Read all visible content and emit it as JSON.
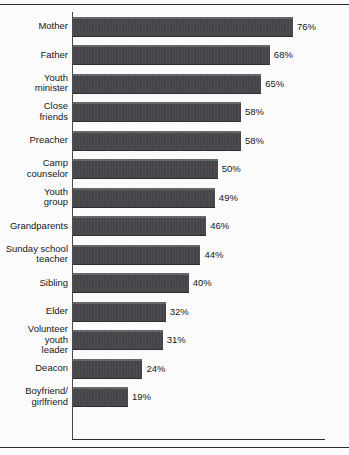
{
  "chart_data": {
    "type": "bar",
    "orientation": "horizontal",
    "title": "",
    "subtitle": "",
    "xlabel": "",
    "ylabel": "",
    "xlim": [
      0,
      87
    ],
    "grid": false,
    "legend": null,
    "value_suffix": "%",
    "categories": [
      "Mother",
      "Father",
      "Youth minister",
      "Close friends",
      "Preacher",
      "Camp counselor",
      "Youth group",
      "Grandparents",
      "Sunday school teacher",
      "Sibling",
      "Elder",
      "Volunteer youth leader",
      "Deacon",
      "Boyfriend/girlfriend"
    ],
    "values": [
      76,
      68,
      65,
      58,
      58,
      50,
      49,
      46,
      44,
      40,
      32,
      31,
      24,
      19
    ],
    "bar_color": "#46464a"
  },
  "rows": [
    {
      "label_lines": [
        "Mother"
      ],
      "value": 76,
      "value_label": "76%"
    },
    {
      "label_lines": [
        "Father"
      ],
      "value": 68,
      "value_label": "68%"
    },
    {
      "label_lines": [
        "Youth",
        "minister"
      ],
      "value": 65,
      "value_label": "65%"
    },
    {
      "label_lines": [
        "Close",
        "friends"
      ],
      "value": 58,
      "value_label": "58%"
    },
    {
      "label_lines": [
        "Preacher"
      ],
      "value": 58,
      "value_label": "58%"
    },
    {
      "label_lines": [
        "Camp",
        "counselor"
      ],
      "value": 50,
      "value_label": "50%"
    },
    {
      "label_lines": [
        "Youth",
        "group"
      ],
      "value": 49,
      "value_label": "49%"
    },
    {
      "label_lines": [
        "Grandparents"
      ],
      "value": 46,
      "value_label": "46%"
    },
    {
      "label_lines": [
        "Sunday school",
        "teacher"
      ],
      "value": 44,
      "value_label": "44%"
    },
    {
      "label_lines": [
        "Sibling"
      ],
      "value": 40,
      "value_label": "40%"
    },
    {
      "label_lines": [
        "Elder"
      ],
      "value": 32,
      "value_label": "32%"
    },
    {
      "label_lines": [
        "Volunteer",
        "youth",
        "leader"
      ],
      "value": 31,
      "value_label": "31%"
    },
    {
      "label_lines": [
        "Deacon"
      ],
      "value": 24,
      "value_label": "24%"
    },
    {
      "label_lines": [
        "Boyfriend/",
        "girlfriend"
      ],
      "value": 19,
      "value_label": "19%"
    }
  ]
}
